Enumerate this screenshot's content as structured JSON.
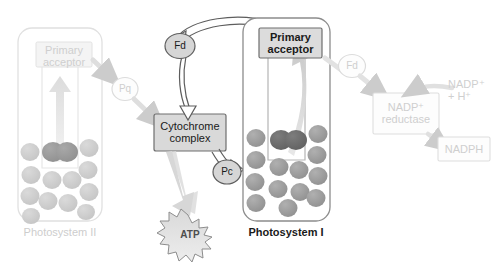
{
  "diagram": {
    "canvas": {
      "width": 497,
      "height": 266
    }
  },
  "colors": {
    "active_text": "#1a1a1a",
    "faded_text": "#cfcfcf",
    "active_stroke": "#555555",
    "faded_stroke": "#d8d8d8",
    "box_fill_active": "#dcdcdc",
    "box_fill_faded": "#f2f2f2",
    "pigment_fill_active": "#9a9a9a",
    "pigment_fill_faded": "#cfcfcf",
    "reaction_center_active": "#6e6e6e",
    "reaction_center_faded": "#9a9a9a",
    "arrow_energy": "#d2d2d2",
    "atp_fill": "#e8e8e8",
    "background": "#ffffff"
  },
  "photosystem_II": {
    "name": "photosystem-ii",
    "label": "Photosystem II",
    "state": "faded",
    "primary_acceptor": {
      "label_line1": "Primary",
      "label_line2": "acceptor",
      "state": "faded"
    },
    "pigment_count": 12,
    "reaction_center_label": ""
  },
  "photosystem_I": {
    "name": "photosystem-i",
    "label": "Photosystem I",
    "state": "active",
    "primary_acceptor": {
      "label_line1": "Primary",
      "label_line2": "acceptor",
      "state": "active"
    },
    "pigment_count": 13,
    "reaction_center_label": ""
  },
  "carriers": [
    {
      "id": "pq",
      "label": "Pq",
      "state": "faded",
      "shape": "ellipse"
    },
    {
      "id": "fd-left",
      "label": "Fd",
      "state": "active",
      "shape": "ellipse"
    },
    {
      "id": "pc",
      "label": "Pc",
      "state": "active",
      "shape": "ellipse"
    },
    {
      "id": "fd-right",
      "label": "Fd",
      "state": "faded",
      "shape": "ellipse"
    }
  ],
  "complexes": [
    {
      "id": "cytochrome-complex",
      "label_line1": "Cytochrome",
      "label_line2": "complex",
      "state": "active"
    },
    {
      "id": "nadp-reductase",
      "label_line1": "NADP⁺",
      "label_line2": "reductase",
      "state": "faded"
    }
  ],
  "products": [
    {
      "id": "atp",
      "label": "ATP",
      "state": "active",
      "shape": "starburst"
    },
    {
      "id": "nadph",
      "label": "NADPH",
      "state": "faded",
      "shape": "rect"
    }
  ],
  "reactants": [
    {
      "id": "nadp-plus-h",
      "label_line1": "NADP⁺",
      "label_line2": "+ H⁺",
      "state": "faded"
    }
  ],
  "flows": [
    {
      "from": "photosystem-ii-primary-acceptor",
      "to": "pq",
      "state": "faded"
    },
    {
      "from": "pq",
      "to": "cytochrome-complex",
      "state": "faded"
    },
    {
      "from": "cytochrome-complex",
      "to": "pc",
      "state": "active"
    },
    {
      "from": "pc",
      "to": "photosystem-i-reaction-center",
      "state": "active"
    },
    {
      "from": "photosystem-i-primary-acceptor",
      "to": "fd-left",
      "state": "active"
    },
    {
      "from": "fd-left",
      "to": "cytochrome-complex",
      "state": "active"
    },
    {
      "from": "photosystem-i-primary-acceptor",
      "to": "fd-right",
      "state": "faded"
    },
    {
      "from": "fd-right",
      "to": "nadp-reductase",
      "state": "faded"
    },
    {
      "from": "nadp-plus-h",
      "to": "nadp-reductase",
      "state": "faded"
    },
    {
      "from": "nadp-reductase",
      "to": "nadph",
      "state": "faded"
    },
    {
      "from": "cytochrome-complex",
      "to": "atp",
      "state": "active"
    }
  ]
}
